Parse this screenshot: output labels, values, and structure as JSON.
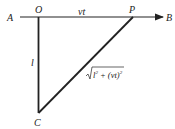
{
  "diagram": {
    "type": "geometry",
    "points": {
      "A": {
        "label": "A"
      },
      "O": {
        "label": "O"
      },
      "P": {
        "label": "P"
      },
      "B": {
        "label": "B"
      },
      "C": {
        "label": "C"
      }
    },
    "segments": {
      "OP": {
        "label": "vt"
      },
      "OC": {
        "label": "l"
      },
      "CP": {
        "label_prefix": "√",
        "label_l": "l",
        "label_mid": " + (vt)",
        "label_exp": "2"
      }
    },
    "colors": {
      "line": "#222222",
      "background": "#ffffff"
    }
  }
}
